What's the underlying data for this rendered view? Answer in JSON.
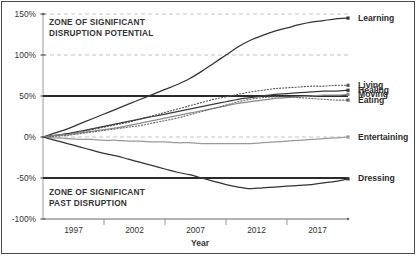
{
  "chart_data": {
    "type": "line",
    "title": "",
    "xlabel": "Year",
    "ylabel": "",
    "xlim": [
      1995,
      2020
    ],
    "ylim": [
      -100,
      150
    ],
    "grid": true,
    "legend_position": "right-endpoint-labels",
    "x_tick_labels": [
      "1997",
      "2002",
      "2007",
      "2012",
      "2017"
    ],
    "y_tick_labels": [
      "150%",
      "100%",
      "50%",
      "0%",
      "-50%",
      "-100%"
    ],
    "y_tick_values": [
      150,
      100,
      50,
      0,
      -50,
      -100
    ],
    "gridlines_dashed_at": [
      150,
      100,
      0
    ],
    "reference_lines": [
      {
        "value": 50,
        "style": "solid-thick",
        "label": "upper disruption threshold"
      },
      {
        "value": -50,
        "style": "solid-thick",
        "label": "lower disruption threshold"
      }
    ],
    "annotations": [
      {
        "text": "ZONE OF SIGNIFICANT\nDISRUPTION POTENTIAL",
        "x": 1995.5,
        "y": 140
      },
      {
        "text": "ZONE OF SIGNIFICANT\nPAST DISRUPTION",
        "x": 1995.5,
        "y": -62
      }
    ],
    "x": [
      1995,
      1996,
      1997,
      1998,
      1999,
      2000,
      2001,
      2002,
      2003,
      2004,
      2005,
      2006,
      2007,
      2008,
      2009,
      2010,
      2011,
      2012,
      2013,
      2014,
      2015,
      2016,
      2017,
      2018,
      2019,
      2020
    ],
    "series": [
      {
        "name": "Learning",
        "style": "solid",
        "color": "#333333",
        "values": [
          0,
          5,
          10,
          16,
          22,
          28,
          34,
          40,
          46,
          52,
          58,
          64,
          71,
          80,
          90,
          100,
          110,
          118,
          124,
          129,
          133,
          137,
          140,
          142,
          144,
          145
        ]
      },
      {
        "name": "Living",
        "style": "dotted",
        "color": "#555555",
        "values": [
          0,
          2,
          4,
          6,
          9,
          12,
          15,
          18,
          22,
          26,
          30,
          34,
          38,
          42,
          46,
          49,
          52,
          55,
          57,
          59,
          60,
          61,
          62,
          62,
          63,
          63
        ]
      },
      {
        "name": "Healing",
        "style": "solid",
        "color": "#3a3a3a",
        "values": [
          0,
          2,
          4,
          7,
          10,
          13,
          16,
          19,
          22,
          25,
          28,
          31,
          34,
          37,
          40,
          43,
          46,
          48,
          50,
          52,
          53,
          54,
          55,
          56,
          56,
          57
        ]
      },
      {
        "name": "Moving",
        "style": "solid",
        "color": "#8a8a8a",
        "values": [
          0,
          2,
          3,
          5,
          7,
          9,
          11,
          14,
          17,
          20,
          23,
          26,
          29,
          32,
          35,
          38,
          41,
          43,
          45,
          47,
          48,
          49,
          50,
          51,
          51,
          52
        ]
      },
      {
        "name": "Eating",
        "style": "dotted",
        "color": "#666666",
        "values": [
          0,
          1,
          2,
          4,
          6,
          8,
          10,
          12,
          14,
          17,
          20,
          23,
          27,
          31,
          35,
          39,
          43,
          46,
          48,
          49,
          49,
          48,
          47,
          46,
          45,
          45
        ]
      },
      {
        "name": "Entertaining",
        "style": "solid",
        "color": "#999999",
        "values": [
          0,
          -1,
          -2,
          -3,
          -3,
          -4,
          -4,
          -5,
          -5,
          -6,
          -6,
          -7,
          -7,
          -8,
          -8,
          -8,
          -8,
          -8,
          -7,
          -6,
          -5,
          -4,
          -3,
          -2,
          -1,
          0
        ]
      },
      {
        "name": "Dressing",
        "style": "solid",
        "color": "#333333",
        "values": [
          0,
          -4,
          -8,
          -12,
          -16,
          -20,
          -23,
          -27,
          -31,
          -35,
          -39,
          -43,
          -46,
          -50,
          -54,
          -58,
          -61,
          -63,
          -62,
          -61,
          -60,
          -59,
          -58,
          -56,
          -54,
          -51
        ]
      }
    ]
  },
  "axis": {
    "x_title": "Year"
  },
  "zones": {
    "top": "ZONE OF SIGNIFICANT\nDISRUPTION POTENTIAL",
    "bottom": "ZONE OF SIGNIFICANT\nPAST DISRUPTION"
  }
}
